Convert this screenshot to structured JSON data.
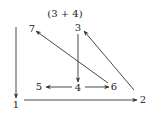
{
  "diagram": {
    "title": "(3 + 4)",
    "nodes": [
      {
        "id": "1",
        "label": "1",
        "x": 16,
        "y": 108
      },
      {
        "id": "2",
        "label": "2",
        "x": 143,
        "y": 103
      },
      {
        "id": "3",
        "label": "3",
        "x": 78,
        "y": 31
      },
      {
        "id": "4",
        "label": "4",
        "x": 78,
        "y": 91
      },
      {
        "id": "5",
        "label": "5",
        "x": 39,
        "y": 90
      },
      {
        "id": "6",
        "label": "6",
        "x": 114,
        "y": 90
      },
      {
        "id": "7",
        "label": "7",
        "x": 32,
        "y": 32
      }
    ],
    "edges": [
      {
        "from": "top",
        "to": "1",
        "x1": 16,
        "y1": 27,
        "x2": 16,
        "y2": 98
      },
      {
        "from": "1",
        "to": "2",
        "x1": 24,
        "y1": 100,
        "x2": 137,
        "y2": 100
      },
      {
        "from": "3",
        "to": "4",
        "x1": 78,
        "y1": 34,
        "x2": 78,
        "y2": 82
      },
      {
        "from": "4",
        "to": "5",
        "x1": 72,
        "y1": 87,
        "x2": 46,
        "y2": 87
      },
      {
        "from": "4",
        "to": "6",
        "x1": 85,
        "y1": 87,
        "x2": 109,
        "y2": 87
      },
      {
        "from": "6",
        "to": "7",
        "x1": 108,
        "y1": 83,
        "x2": 36,
        "y2": 31
      },
      {
        "from": "2",
        "to": "3",
        "x1": 134,
        "y1": 90,
        "x2": 84,
        "y2": 31
      }
    ]
  }
}
